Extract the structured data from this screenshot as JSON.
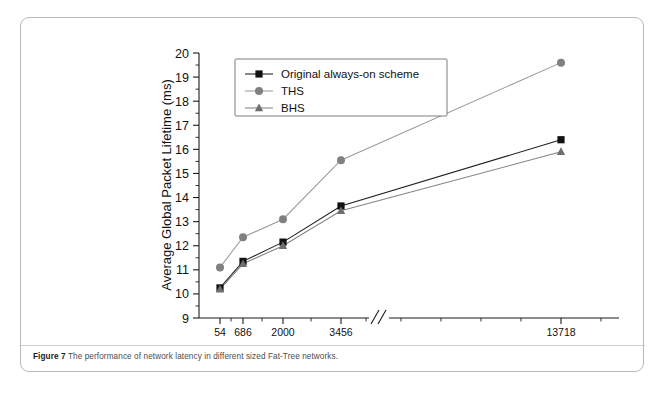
{
  "figure": {
    "label": "Figure 7",
    "caption": "The performance of network latency in different sized Fat-Tree networks."
  },
  "chart_data": {
    "type": "line",
    "title": "",
    "xlabel": "Number of Servers",
    "ylabel": "Average Global Packet Lifetime (ms)",
    "categories": [
      "54",
      "686",
      "2000",
      "3456",
      "13718"
    ],
    "x_axis_break_after_category": "3456",
    "x_axis_break_symbol": "//",
    "ylim": [
      9,
      20
    ],
    "ytick_labels": [
      "9",
      "10",
      "11",
      "12",
      "13",
      "14",
      "15",
      "16",
      "17",
      "18",
      "19",
      "20"
    ],
    "ytick_values": [
      9,
      10,
      11,
      12,
      13,
      14,
      15,
      16,
      17,
      18,
      19,
      20
    ],
    "grid": false,
    "legend_position": "top-left-inside",
    "series": [
      {
        "name": "Original always-on scheme",
        "marker": "square",
        "color": "#111111",
        "line_color": "#1d1d1d",
        "values": [
          10.25,
          11.35,
          12.15,
          13.65,
          16.4
        ]
      },
      {
        "name": "THS",
        "marker": "circle",
        "color": "#808080",
        "line_color": "#9a9a9a",
        "values": [
          11.1,
          12.35,
          13.1,
          15.55,
          19.6
        ]
      },
      {
        "name": "BHS",
        "marker": "triangle",
        "color": "#6e6e6e",
        "line_color": "#848484",
        "values": [
          10.2,
          11.25,
          12.0,
          13.45,
          15.9
        ]
      }
    ]
  }
}
